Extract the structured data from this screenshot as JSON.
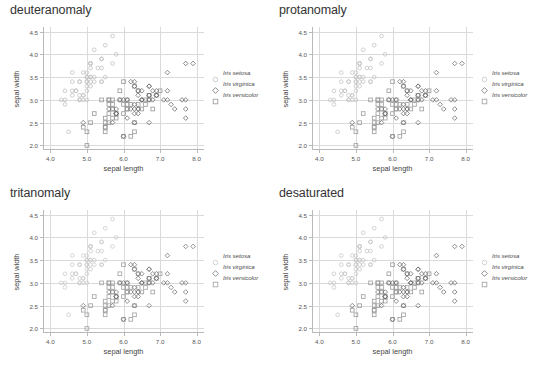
{
  "figure": {
    "background": "#ffffff",
    "layout": "2x2 grid of scatter panels"
  },
  "axes": {
    "xlabel": "sepal length",
    "ylabel": "sepal width",
    "xticks": [
      "4.0",
      "5.0",
      "6.0",
      "7.0",
      "8.0"
    ],
    "yticks": [
      "2.0",
      "2.5",
      "3.0",
      "3.5",
      "4.0",
      "4.5"
    ],
    "xlim": [
      3.8,
      8.2
    ],
    "ylim": [
      1.9,
      4.6
    ],
    "grid": true,
    "tick_color": "#b9b9b9",
    "grid_color": "#dadada",
    "label_color": "#444444"
  },
  "legend": {
    "position": "right of plot",
    "entries": [
      {
        "label": "Iris setosa",
        "marker": "circle-open",
        "color": "#b8b8b8"
      },
      {
        "label": "Iris virginica",
        "marker": "diamond-open",
        "color": "#6e6e6e"
      },
      {
        "label": "Iris versicolor",
        "marker": "square-open",
        "color": "#909090"
      }
    ]
  },
  "panels": [
    {
      "id": "deuteranomaly",
      "title": "deuteranomaly",
      "colors": {
        "setosa": "#c0c0c0",
        "virginica": "#6a6a6a",
        "versicolor": "#949494"
      }
    },
    {
      "id": "protanomaly",
      "title": "protanomaly",
      "colors": {
        "setosa": "#c4c4c4",
        "virginica": "#707070",
        "versicolor": "#9a9a9a"
      }
    },
    {
      "id": "tritanomaly",
      "title": "tritanomaly",
      "colors": {
        "setosa": "#cacaca",
        "virginica": "#747474",
        "versicolor": "#9d9d9d"
      }
    },
    {
      "id": "desaturated",
      "title": "desaturated",
      "colors": {
        "setosa": "#c7c7c7",
        "virginica": "#6d6d6d",
        "versicolor": "#989898"
      }
    }
  ],
  "chart_data": {
    "type": "scatter",
    "xlabel": "sepal length",
    "ylabel": "sepal width",
    "xlim": [
      3.8,
      8.2
    ],
    "ylim": [
      1.9,
      4.6
    ],
    "grid": true,
    "legend_position": "right",
    "panel_titles": [
      "deuteranomaly",
      "protanomaly",
      "tritanomaly",
      "desaturated"
    ],
    "series": [
      {
        "name": "Iris setosa",
        "marker": "circle-open",
        "x": [
          5.1,
          4.9,
          4.7,
          4.6,
          5.0,
          5.4,
          4.6,
          5.0,
          4.4,
          4.9,
          5.4,
          4.8,
          4.8,
          4.3,
          5.8,
          5.7,
          5.4,
          5.1,
          5.7,
          5.1,
          5.4,
          5.1,
          4.6,
          5.1,
          4.8,
          5.0,
          5.0,
          5.2,
          5.2,
          4.7,
          4.8,
          5.4,
          5.2,
          5.5,
          4.9,
          5.0,
          5.5,
          4.9,
          4.4,
          5.1,
          5.0,
          4.5,
          4.4,
          5.0,
          5.1,
          4.8,
          5.1,
          4.6,
          5.3,
          5.0
        ],
        "y": [
          3.5,
          3.0,
          3.2,
          3.1,
          3.6,
          3.9,
          3.4,
          3.4,
          2.9,
          3.1,
          3.7,
          3.4,
          3.0,
          3.0,
          4.0,
          4.4,
          3.9,
          3.5,
          3.8,
          3.8,
          3.4,
          3.7,
          3.6,
          3.3,
          3.4,
          3.0,
          3.4,
          3.5,
          3.4,
          3.2,
          3.1,
          3.4,
          4.1,
          4.2,
          3.1,
          3.2,
          3.5,
          3.6,
          3.0,
          3.4,
          3.5,
          2.3,
          3.2,
          3.5,
          3.8,
          3.0,
          3.8,
          3.2,
          3.7,
          3.3
        ]
      },
      {
        "name": "Iris versicolor",
        "marker": "square-open",
        "x": [
          7.0,
          6.4,
          6.9,
          5.5,
          6.5,
          5.7,
          6.3,
          4.9,
          6.6,
          5.2,
          5.0,
          5.9,
          6.0,
          6.1,
          5.6,
          6.7,
          5.6,
          5.8,
          6.2,
          5.6,
          5.9,
          6.1,
          6.3,
          6.1,
          6.4,
          6.6,
          6.8,
          6.7,
          6.0,
          5.7,
          5.5,
          5.5,
          5.8,
          6.0,
          5.4,
          6.0,
          6.7,
          6.3,
          5.6,
          5.5,
          5.5,
          6.1,
          5.8,
          5.0,
          5.6,
          5.7,
          5.7,
          6.2,
          5.1,
          5.7
        ],
        "y": [
          3.2,
          3.2,
          3.1,
          2.3,
          2.8,
          2.8,
          3.3,
          2.4,
          2.9,
          2.7,
          2.0,
          3.0,
          2.2,
          2.9,
          2.9,
          3.1,
          3.0,
          2.7,
          2.2,
          2.5,
          3.2,
          2.8,
          2.5,
          2.8,
          2.9,
          3.0,
          2.8,
          3.0,
          2.9,
          2.6,
          2.4,
          2.4,
          2.7,
          2.7,
          3.0,
          3.4,
          3.1,
          2.3,
          3.0,
          2.5,
          2.6,
          3.0,
          2.6,
          2.3,
          2.7,
          3.0,
          2.9,
          2.9,
          2.5,
          2.8
        ]
      },
      {
        "name": "Iris virginica",
        "marker": "diamond-open",
        "x": [
          6.3,
          5.8,
          7.1,
          6.3,
          6.5,
          7.6,
          4.9,
          7.3,
          6.7,
          7.2,
          6.5,
          6.4,
          6.8,
          5.7,
          5.8,
          6.4,
          6.5,
          7.7,
          7.7,
          6.0,
          6.9,
          5.6,
          7.7,
          6.3,
          6.7,
          7.2,
          6.2,
          6.1,
          6.4,
          7.2,
          7.4,
          7.9,
          6.4,
          6.3,
          6.1,
          7.7,
          6.3,
          6.4,
          6.0,
          6.9,
          6.7,
          6.9,
          5.8,
          6.8,
          6.7,
          6.7,
          6.3,
          6.5,
          6.2,
          5.9
        ],
        "y": [
          3.3,
          2.7,
          3.0,
          2.9,
          3.0,
          3.0,
          2.5,
          2.9,
          2.5,
          3.6,
          3.2,
          2.7,
          3.0,
          2.5,
          2.8,
          3.2,
          3.0,
          3.8,
          2.6,
          2.2,
          3.2,
          2.8,
          2.8,
          2.7,
          3.3,
          3.2,
          2.8,
          3.0,
          2.8,
          3.0,
          2.8,
          3.8,
          2.8,
          2.8,
          2.6,
          3.0,
          3.4,
          3.1,
          3.0,
          3.1,
          3.1,
          3.1,
          2.7,
          3.2,
          3.3,
          3.0,
          2.5,
          3.0,
          3.4,
          3.0
        ]
      }
    ]
  }
}
